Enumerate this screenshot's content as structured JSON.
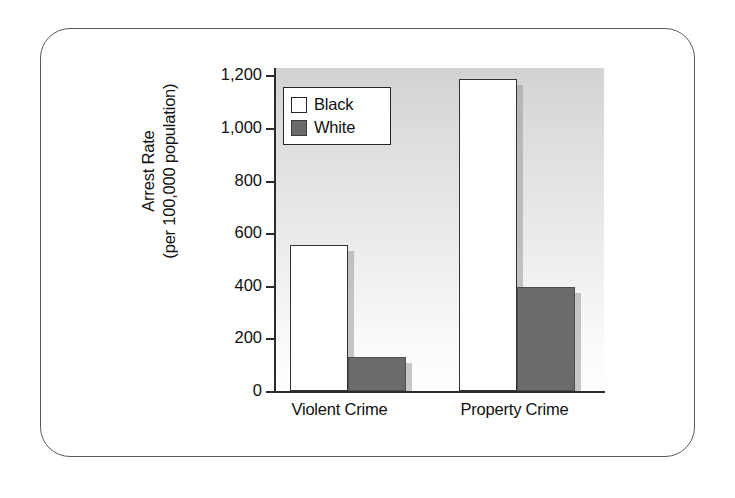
{
  "chart_data": {
    "type": "bar",
    "title": "",
    "xlabel": "",
    "ylabel_line1": "Arrest Rate",
    "ylabel_line2": "(per 100,000 population)",
    "categories": [
      "Violent Crime",
      "Property Crime"
    ],
    "series": [
      {
        "name": "Black",
        "values": [
          556,
          1185
        ],
        "color": "#ffffff",
        "border": "#333333"
      },
      {
        "name": "White",
        "values": [
          129,
          394
        ],
        "color": "#6b6b6b",
        "border": "#4e4e4e"
      }
    ],
    "ylim": [
      0,
      1200
    ],
    "yticks": [
      0,
      200,
      400,
      600,
      800,
      1000,
      1200
    ],
    "ytick_labels": [
      "0",
      "200",
      "400",
      "600",
      "800",
      "1,000",
      "1,200"
    ],
    "grid": false,
    "legend_position": "upper-left-inside",
    "legend_entries": [
      "Black",
      "White"
    ]
  },
  "legend": {
    "entries": [
      {
        "label": "Black"
      },
      {
        "label": "White"
      }
    ]
  },
  "axis": {
    "y_title_line1": "Arrest Rate",
    "y_title_line2": "(per 100,000 population)",
    "tick_0": "0",
    "tick_200": "200",
    "tick_400": "400",
    "tick_600": "600",
    "tick_800": "800",
    "tick_1000": "1,000",
    "tick_1200": "1,200"
  },
  "categories": {
    "cat0": "Violent Crime",
    "cat1": "Property Crime"
  }
}
